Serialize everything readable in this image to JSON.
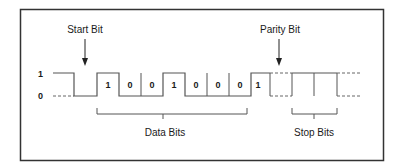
{
  "diagram": {
    "colors": {
      "line": "#555555",
      "frame": "#333333",
      "text": "#1a1a1a"
    },
    "levels": {
      "high_label": "1",
      "low_label": "0"
    },
    "annotations": {
      "start_bit": "Start Bit",
      "parity_bit": "Parity Bit",
      "data_bits": "Data Bits",
      "stop_bits": "Stop Bits"
    },
    "data_bits": [
      "1",
      "0",
      "0",
      "1",
      "0",
      "0",
      "0",
      "1"
    ],
    "bit_values": {
      "b0": "1",
      "b1": "0",
      "b2": "0",
      "b3": "1",
      "b4": "0",
      "b5": "0",
      "b6": "0",
      "b7": "1"
    }
  }
}
